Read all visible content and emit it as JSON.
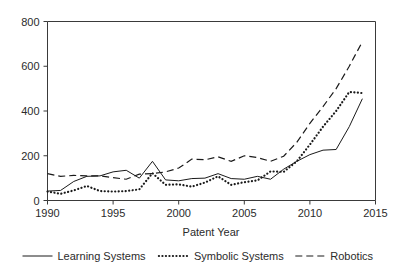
{
  "chart_data": {
    "type": "line",
    "title": "",
    "subtitle": "",
    "xlabel": "Patent Year",
    "ylabel": "",
    "xlim": [
      1990,
      2015
    ],
    "ylim": [
      0,
      800
    ],
    "xticks": [
      1990,
      1995,
      2000,
      2005,
      2010,
      2015
    ],
    "xtick_labels": [
      "1990",
      "1995",
      "2000",
      "2005",
      "2010",
      "2015"
    ],
    "yticks": [
      0,
      200,
      400,
      600,
      800
    ],
    "ytick_labels": [
      "0",
      "200",
      "400",
      "600",
      "800"
    ],
    "grid": false,
    "legend_position": "below",
    "x": [
      1990,
      1991,
      1992,
      1993,
      1994,
      1995,
      1996,
      1997,
      1998,
      1999,
      2000,
      2001,
      2002,
      2003,
      2004,
      2005,
      2006,
      2007,
      2008,
      2009,
      2010,
      2011,
      2012,
      2013,
      2014
    ],
    "series": [
      {
        "name": "Learning Systems",
        "style": "solid",
        "color": "#1a1a1a",
        "values": [
          42,
          45,
          85,
          108,
          110,
          128,
          135,
          100,
          175,
          92,
          88,
          98,
          100,
          120,
          98,
          95,
          108,
          95,
          140,
          175,
          205,
          225,
          228,
          330,
          455
        ]
      },
      {
        "name": "Symbolic Systems",
        "style": "dotted",
        "color": "#1a1a1a",
        "values": [
          40,
          30,
          45,
          65,
          42,
          40,
          42,
          50,
          122,
          70,
          72,
          62,
          80,
          108,
          70,
          82,
          90,
          130,
          128,
          175,
          250,
          330,
          400,
          485,
          480
        ]
      },
      {
        "name": "Robotics",
        "style": "dashed",
        "color": "#1a1a1a",
        "values": [
          120,
          108,
          112,
          110,
          110,
          102,
          95,
          118,
          120,
          128,
          145,
          185,
          182,
          195,
          175,
          200,
          192,
          175,
          198,
          260,
          345,
          420,
          500,
          600,
          710
        ]
      }
    ],
    "legend": [
      {
        "label": "Learning Systems",
        "style": "solid"
      },
      {
        "label": "Symbolic Systems",
        "style": "dotted"
      },
      {
        "label": "Robotics",
        "style": "dashed"
      }
    ]
  }
}
